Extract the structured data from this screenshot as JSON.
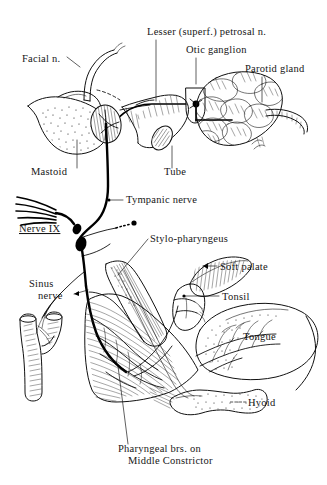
{
  "figure": {
    "background_color": "#ffffff",
    "ink_color": "#111111",
    "width": 327,
    "height": 485
  },
  "labels": {
    "facial_nerve": "Facial n.",
    "lesser_petrosal": "Lesser (superf.) petrosal n.",
    "otic_ganglion": "Otic ganglion",
    "parotid_gland": "Parotid gland",
    "mastoid": "Mastoid",
    "tube": "Tube",
    "tympanic_nerve": "Tympanic nerve",
    "nerve_ix": "Nerve IX",
    "stylopharyngeus": "Stylo-pharyngeus",
    "sinus_nerve_line1": "Sinus",
    "sinus_nerve_line2": "nerve",
    "soft_palate": "Soft palate",
    "tonsil": "Tonsil",
    "tongue": "Tongue",
    "hyoid": "Hyoid",
    "pharyngeal_line1": "Pharyngeal brs. on",
    "pharyngeal_line2": "Middle Constrictor"
  },
  "structures": [
    {
      "name": "facial-nerve",
      "style": "double-outline-tube"
    },
    {
      "name": "lesser-petrosal-nerve",
      "style": "solid-line"
    },
    {
      "name": "otic-ganglion",
      "style": "box-with-dot"
    },
    {
      "name": "parotid-gland",
      "style": "lobulated-mass"
    },
    {
      "name": "mastoid-process",
      "style": "stippled-bone"
    },
    {
      "name": "tympanic-membrane",
      "style": "hatched-oval"
    },
    {
      "name": "auditory-tube",
      "style": "ribbed-tube"
    },
    {
      "name": "tympanic-nerve",
      "style": "nerve-line"
    },
    {
      "name": "nerve-ix-rootlets",
      "style": "fan-of-rootlets"
    },
    {
      "name": "nerve-ix-ganglia",
      "style": "two-swellings"
    },
    {
      "name": "stylopharyngeus-muscle",
      "style": "striated-muscle"
    },
    {
      "name": "carotid-bifurcation",
      "style": "hatched-vessel"
    },
    {
      "name": "soft-palate",
      "style": "hatched-crescent"
    },
    {
      "name": "tonsil",
      "style": "outlined-mass"
    },
    {
      "name": "tongue",
      "style": "stippled-oval"
    },
    {
      "name": "hyoid-bone",
      "style": "stippled-bone"
    },
    {
      "name": "middle-constrictor",
      "style": "striated-muscle-fan"
    }
  ]
}
